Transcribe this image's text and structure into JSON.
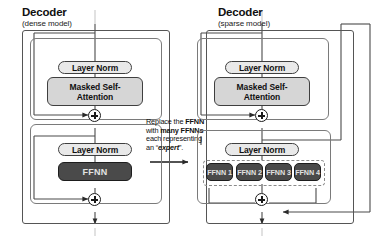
{
  "diagram": {
    "type": "architecture-diagram",
    "panels": [
      {
        "id": "dense",
        "heading": "Decoder",
        "subheading": "(dense model)",
        "blocks": [
          {
            "name": "layer-norm-1",
            "label": "Layer Norm",
            "style": "light"
          },
          {
            "name": "masked-self-attention",
            "label": "Masked Self-\nAttention",
            "line1": "Masked Self-",
            "line2": "Attention",
            "style": "medium"
          },
          {
            "name": "add-1",
            "label": "+",
            "style": "plus"
          },
          {
            "name": "layer-norm-2",
            "label": "Layer Norm",
            "style": "light"
          },
          {
            "name": "ffnn",
            "label": "FFNN",
            "style": "dark"
          },
          {
            "name": "add-2",
            "label": "+",
            "style": "plus"
          }
        ]
      },
      {
        "id": "sparse",
        "heading": "Decoder",
        "subheading": "(sparse model)",
        "blocks": [
          {
            "name": "layer-norm-1",
            "label": "Layer Norm",
            "style": "light"
          },
          {
            "name": "masked-self-attention",
            "label": "Masked Self-\nAttention",
            "line1": "Masked Self-",
            "line2": "Attention",
            "style": "medium"
          },
          {
            "name": "add-1",
            "label": "+",
            "style": "plus"
          },
          {
            "name": "layer-norm-2",
            "label": "Layer Norm",
            "style": "light"
          },
          {
            "name": "add-2",
            "label": "+",
            "style": "plus"
          }
        ],
        "experts": [
          {
            "name": "expert-1",
            "label": "FFNN 1"
          },
          {
            "name": "expert-2",
            "label": "FFNN 2"
          },
          {
            "name": "expert-3",
            "label": "FFNN 3"
          },
          {
            "name": "expert-4",
            "label": "FFNN 4"
          }
        ]
      }
    ],
    "annotation": {
      "line1_pre": "Replace the ",
      "line1_bold": "FFNN",
      "line2_pre": "with ",
      "line2_bold": "many FFNNs",
      "line3": "each representing",
      "line4_pre": "an “",
      "line4_em": "expert",
      "line4_post": "”."
    },
    "colors": {
      "light_box_fill": "#e9e9e9",
      "medium_box_fill": "#d6d6d6",
      "dark_box_fill": "#4a4a4a",
      "dark_box_text": "#e2e2e2",
      "outline": "#3f3f3f",
      "shell_outline": "#555555",
      "dashed_outline": "#8a8a8a",
      "background": "#ffffff",
      "wire": "#4a4a4a"
    }
  }
}
